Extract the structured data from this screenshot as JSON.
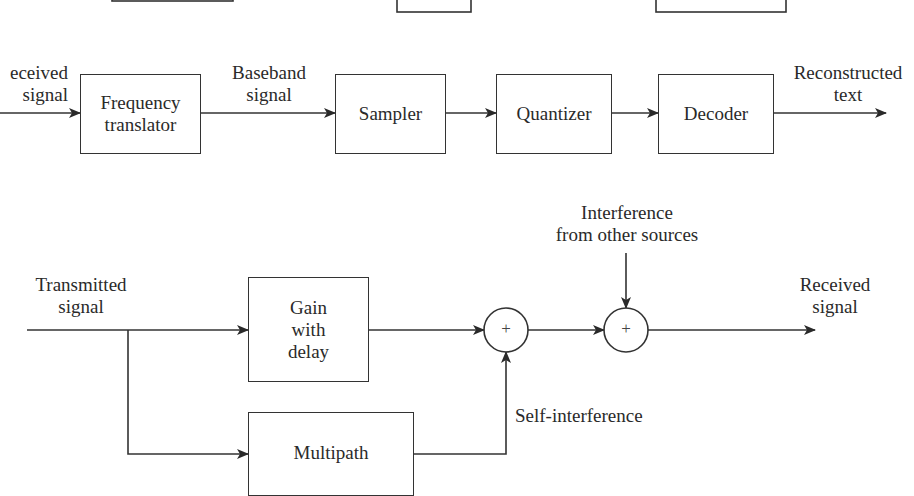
{
  "top_diagram_partial": {
    "boxes": [
      {
        "id": "partial-box-1",
        "x": 112,
        "y": -40,
        "w": 121,
        "h": 41
      },
      {
        "id": "partial-box-2",
        "x": 397,
        "y": -30,
        "w": 74,
        "h": 42
      },
      {
        "id": "partial-box-3",
        "x": 656,
        "y": -30,
        "w": 130,
        "h": 42
      }
    ]
  },
  "receiver_chain": {
    "input_label_line1": "eceived",
    "input_label_line2": "signal",
    "blocks": [
      {
        "label_line1": "Frequency",
        "label_line2": "translator"
      },
      {
        "label_line1": "Sampler"
      },
      {
        "label_line1": "Quantizer"
      },
      {
        "label_line1": "Decoder"
      }
    ],
    "baseband_label_line1": "Baseband",
    "baseband_label_line2": "signal",
    "output_label_line1": "Reconstructed",
    "output_label_line2": "text"
  },
  "channel_model": {
    "input_label_line1": "Transmitted",
    "input_label_line2": "signal",
    "gain_block": {
      "line1": "Gain",
      "line2": "with",
      "line3": "delay"
    },
    "multipath_block": {
      "line1": "Multipath"
    },
    "summer1_symbol": "+",
    "summer2_symbol": "+",
    "interference_label_line1": "Interference",
    "interference_label_line2": "from other sources",
    "self_interference_label": "Self-interference",
    "output_label_line1": "Received",
    "output_label_line2": "signal"
  },
  "colors": {
    "line": "#333333",
    "text": "#2a2a2a",
    "background": "#ffffff"
  }
}
